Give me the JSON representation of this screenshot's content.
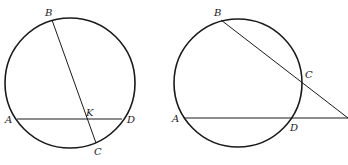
{
  "figures": [
    {
      "name": "intersecting-chords",
      "labels": {
        "A": "A",
        "B": "B",
        "C": "C",
        "D": "D",
        "K": "K"
      }
    },
    {
      "name": "secants-from-external-point",
      "labels": {
        "A": "A",
        "B": "B",
        "C": "C",
        "D": "D"
      }
    }
  ]
}
